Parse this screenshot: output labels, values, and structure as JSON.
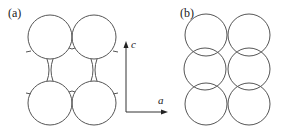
{
  "panels": {
    "a": {
      "label": "(a)"
    },
    "b": {
      "label": "(b)"
    }
  },
  "axes": {
    "vertical_label": "c",
    "horizontal_label": "a"
  },
  "colors": {
    "stroke": "#555555",
    "text": "#222222",
    "background": "#ffffff"
  }
}
